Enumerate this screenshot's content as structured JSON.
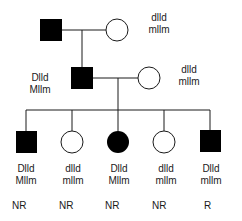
{
  "colors": {
    "affected": "#000000",
    "unaffected": "#ffffff",
    "line": "#1a1a1a",
    "text": "#1a1a1a"
  },
  "generation_1": {
    "father": {
      "sex": "male",
      "affected": true,
      "genotype": [
        "",
        ""
      ]
    },
    "mother": {
      "sex": "female",
      "affected": false,
      "genotype": [
        "dlld",
        "mllm"
      ]
    }
  },
  "generation_2": {
    "son": {
      "sex": "male",
      "affected": true,
      "genotype": [
        "Dlld",
        "Mllm"
      ]
    },
    "spouse": {
      "sex": "female",
      "affected": false,
      "genotype": [
        "dlld",
        "mllm"
      ]
    }
  },
  "generation_3": {
    "children": [
      {
        "sex": "male",
        "affected": true,
        "genotype": [
          "Dlld",
          "Mllm"
        ],
        "status": "NR"
      },
      {
        "sex": "female",
        "affected": false,
        "genotype": [
          "dlld",
          "mllm"
        ],
        "status": "NR"
      },
      {
        "sex": "female",
        "affected": true,
        "genotype": [
          "Dlld",
          "Mllm"
        ],
        "status": "NR"
      },
      {
        "sex": "female",
        "affected": false,
        "genotype": [
          "dlld",
          "mllm"
        ],
        "status": "NR"
      },
      {
        "sex": "male",
        "affected": true,
        "genotype": [
          "Dlld",
          "mllm"
        ],
        "status": "R"
      }
    ]
  }
}
